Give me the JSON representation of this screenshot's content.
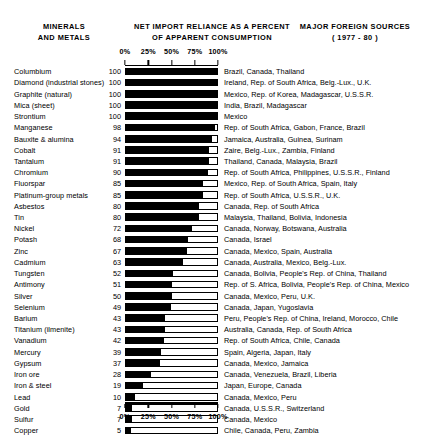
{
  "headers": {
    "minerals": "MINERALS\nAND METALS",
    "reliance": "NET IMPORT RELIANCE AS A PERCENT\nOF APPARENT CONSUMPTION",
    "sources": "MAJOR FOREIGN SOURCES\n( 1977 - 80 )"
  },
  "axis": {
    "ticks": [
      "0%",
      "25%",
      "50%",
      "75%",
      "100%"
    ],
    "tick_values": [
      0,
      25,
      50,
      75,
      100
    ],
    "min": 0,
    "max": 100
  },
  "chart_data": {
    "type": "bar",
    "title": "NET IMPORT RELIANCE AS A PERCENT OF APPARENT CONSUMPTION",
    "subtitle": "MAJOR FOREIGN SOURCES ( 1977 - 80 )",
    "xlabel": "",
    "ylabel": "MINERALS AND METALS",
    "xlim": [
      0,
      100
    ],
    "grid": false,
    "orientation": "horizontal",
    "categories": [
      "Columbium",
      "Diamond (industrial stones)",
      "Graphite (natural)",
      "Mica (sheet)",
      "Strontium",
      "Manganese",
      "Bauxite & alumina",
      "Cobalt",
      "Tantalum",
      "Chromium",
      "Fluorspar",
      "Platinum-group metals",
      "Asbestos",
      "Tin",
      "Nickel",
      "Potash",
      "Zinc",
      "Cadmium",
      "Tungsten",
      "Antimony",
      "Silver",
      "Selenium",
      "Barium",
      "Titanium (ilmenite)",
      "Vanadium",
      "Mercury",
      "Gypsum",
      "Iron ore",
      "Iron & steel",
      "Lead",
      "Gold",
      "Sulfur",
      "Copper"
    ],
    "values": [
      100,
      100,
      100,
      100,
      100,
      98,
      94,
      91,
      91,
      90,
      85,
      85,
      80,
      80,
      72,
      68,
      67,
      63,
      52,
      51,
      50,
      49,
      43,
      43,
      42,
      39,
      37,
      28,
      19,
      10,
      7,
      7,
      5
    ],
    "sources": [
      "Brazil, Canada, Thailand",
      "Ireland, Rep. of South Africa, Belg.-Lux., U.K.",
      "Mexico, Rep. of Korea, Madagascar, U.S.S.R.",
      "India, Brazil, Madagascar",
      "Mexico",
      "Rep. of South Africa, Gabon, France, Brazil",
      "Jamaica, Australia, Guinea, Surinam",
      "Zaire, Belg.-Lux., Zambia, Finland",
      "Thailand, Canada, Malaysia, Brazil",
      "Rep. of South Africa, Philippines, U.S.S.R., Finland",
      "Mexico, Rep. of South Africa, Spain, Italy",
      "Rep. of South Africa, U.S.S.R., U.K.",
      "Canada, Rep. of South Africa",
      "Malaysia, Thailand, Bolivia, Indonesia",
      "Canada, Norway, Botswana, Australia",
      "Canada, Israel",
      "Canada, Mexico, Spain, Australia",
      "Canada, Australia, Mexico, Belg.-Lux.",
      "Canada, Bolivia, People's Rep. of China, Thailand",
      "Rep. of S. Africa, Bolivia, People's Rep. of China, Mexico",
      "Canada, Mexico, Peru, U.K.",
      "Canada, Japan, Yugoslavia",
      "Peru, People's Rep. of China, Ireland, Morocco, Chile",
      "Australia, Canada, Rep. of South Africa",
      "Rep. of South Africa, Chile, Canada",
      "Spain, Algeria, Japan, Italy",
      "Canada, Mexico, Jamaica",
      "Canada, Venezuela, Brazil, Liberia",
      "Japan, Europe, Canada",
      "Canada, Mexico, Peru",
      "Canada, U.S.S.R., Switzerland",
      "Canada, Mexico",
      "Chile, Canada, Peru, Zambia"
    ]
  },
  "layout": {
    "plot_left_px": 125,
    "plot_right_px": 218,
    "value_col_right_px": 121,
    "sources_left_px": 224,
    "row_height_px": 11.22
  },
  "colors": {
    "bar_fill": "#000000",
    "bar_outline": "#000000",
    "background": "#ffffff",
    "text": "#000000"
  }
}
